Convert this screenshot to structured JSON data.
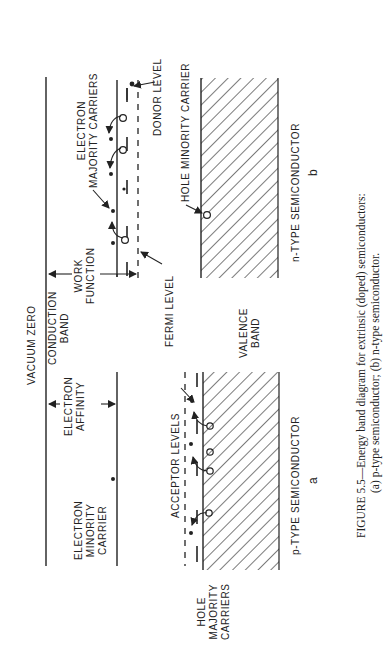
{
  "figure": {
    "caption_line1": "FIGURE 5.5—Energy band diagram for extrinsic (doped) semiconductors:",
    "caption_line2": "(a) p-type semiconductor; (b) n-type semiconductor.",
    "orientation": "rotated 90° counter-clockwise",
    "colors": {
      "ink": "#222222",
      "background": "#ffffff"
    }
  },
  "labels": {
    "vacuum_zero": "VACUUM ZERO",
    "conduction_band": "CONDUCTION\nBAND",
    "valence_band": "VALENCE\nBAND",
    "fermi_level": "FERMI LEVEL",
    "work_function": "WORK\nFUNCTION",
    "electron_affinity": "ELECTRON\nAFFINITY",
    "electron_majority_carriers": "ELECTRON\nMAJORITY CARRIERS",
    "donor_level": "DONOR LEVEL",
    "hole_minority_carrier": "HOLE MINORITY CARRIER",
    "electron_minority_carrier": "ELECTRON\nMINORITY\nCARRIER",
    "acceptor_levels": "ACCEPTOR LEVELS",
    "hole_majority_carriers": "HOLE\nMAJORITY\nCARRIERS",
    "p_type": "p-TYPE SEMICONDUCTOR",
    "n_type": "n-TYPE SEMICONDUCTOR",
    "panel_a": "a",
    "panel_b": "b"
  },
  "panels": [
    {
      "id": "a",
      "type": "p-type semiconductor",
      "features": [
        "electron minority carrier",
        "acceptor levels",
        "hole majority carriers",
        "electron affinity"
      ]
    },
    {
      "id": "b",
      "type": "n-type semiconductor",
      "features": [
        "electron majority carriers",
        "donor level",
        "hole minority carrier",
        "work function",
        "fermi level"
      ]
    }
  ]
}
